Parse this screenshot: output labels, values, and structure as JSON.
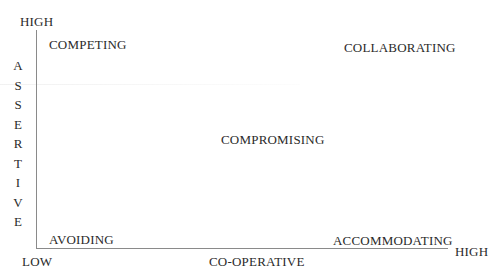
{
  "diagram": {
    "type": "conflict-mode-quadrant",
    "y_axis": {
      "high_label": "HIGH",
      "low_label": "LOW",
      "title_letters": [
        "A",
        "S",
        "S",
        "E",
        "R",
        "T",
        "I",
        "V",
        "E"
      ],
      "title": "ASSERTIVE"
    },
    "x_axis": {
      "high_label": "HIGH",
      "title": "CO-OPERATIVE"
    },
    "regions": {
      "top_left": "COMPETING",
      "top_right": "COLLABORATING",
      "center": "COMPROMISING",
      "bottom_left": "AVOIDING",
      "bottom_right": "ACCOMMODATING"
    },
    "colors": {
      "text": "#2a2a2a",
      "axis": "#8a8a8a",
      "background": "#ffffff"
    }
  }
}
